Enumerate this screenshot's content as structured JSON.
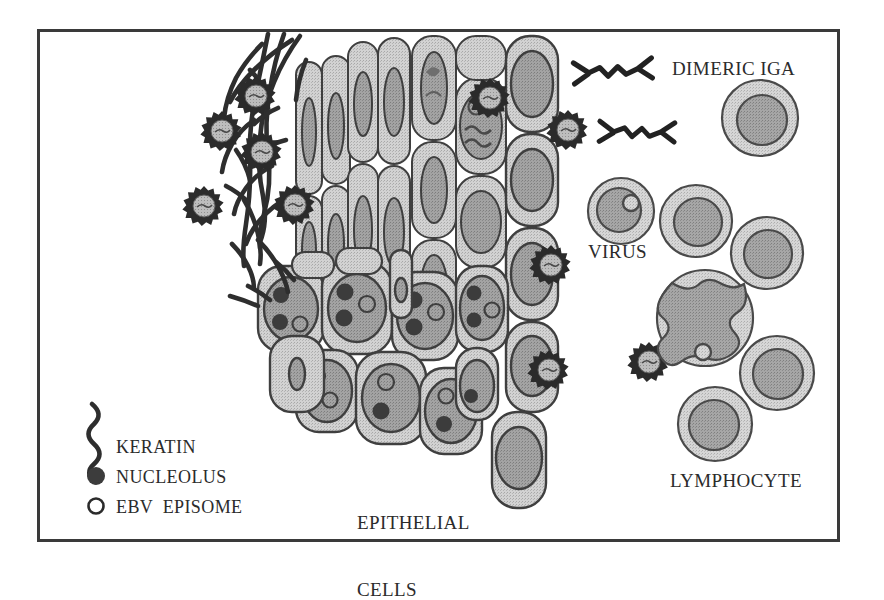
{
  "figure": {
    "background_color": "#ffffff",
    "frame": {
      "stroke_color": "#3a3a3a",
      "x": 38,
      "y": 30,
      "width": 800,
      "height": 510
    }
  },
  "palette": {
    "ink": "#2b2b2b",
    "outline": "#404040",
    "cytoplasm": "#c9c9c9",
    "nucleus": "#989898",
    "nucleolus": "#3c3c3c",
    "episome_fill": "#c9c9c9",
    "keratin": "#2e2e2e",
    "virus_spike": "#2b2b2b",
    "virus_core": "#b4b4b4",
    "lymph_cytoplasm": "#cfcfcf",
    "lymph_nucleus": "#9a9a9a"
  },
  "labels": {
    "dimeric_iga": "DIMERIC IGA",
    "virus": "VIRUS",
    "epithelial_cells_line1": "EPITHELIAL",
    "epithelial_cells_line2": "CELLS",
    "lymphocyte": "LYMPHOCYTE"
  },
  "legend": {
    "items": [
      {
        "key": "keratin",
        "symbol": "squiggle-line",
        "label": "KERATIN"
      },
      {
        "key": "nucleolus",
        "symbol": "filled-circle",
        "label": "NUCLEOLUS"
      },
      {
        "key": "episome",
        "symbol": "open-circle",
        "label": "EBV  EPISOME"
      }
    ]
  },
  "diagram_content": {
    "regions": [
      {
        "name": "lumen",
        "description": "empty space at left containing free virus particles"
      },
      {
        "name": "keratin-layer",
        "description": "dense dark keratin fiber meshwork at epithelial surface with embedded virions"
      },
      {
        "name": "squamous-layer",
        "description": "thin flattened epithelial cells with elongated nuclei"
      },
      {
        "name": "columnar-layer",
        "description": "taller epithelial cells with round nuclei, some containing replicating virus"
      },
      {
        "name": "basal-layer",
        "description": "rounded basal epithelial cells with nucleoli and EBV episomes"
      },
      {
        "name": "lymphoid-space",
        "description": "right field containing lymphocytes and free virus"
      }
    ],
    "free_viruses": [
      {
        "cx": 222,
        "cy": 131,
        "r": 19
      },
      {
        "cx": 204,
        "cy": 206,
        "r": 19
      },
      {
        "cx": 256,
        "cy": 96,
        "r": 18
      },
      {
        "cx": 262,
        "cy": 152,
        "r": 18
      },
      {
        "cx": 295,
        "cy": 205,
        "r": 18
      },
      {
        "cx": 504,
        "cy": 112,
        "r": 17
      },
      {
        "cx": 568,
        "cy": 130,
        "r": 20
      },
      {
        "cx": 551,
        "cy": 265,
        "r": 19
      },
      {
        "cx": 549,
        "cy": 370,
        "r": 19
      },
      {
        "cx": 649,
        "cy": 362,
        "r": 19
      },
      {
        "cx": 490,
        "cy": 98,
        "r": 17
      }
    ],
    "epithelial_cells_count": 38,
    "lymphocytes": [
      {
        "cx": 760,
        "cy": 118,
        "r": 38,
        "nucleus_r": 25,
        "episome": false,
        "lobulated": false
      },
      {
        "cx": 621,
        "cy": 211,
        "r": 33,
        "nucleus_r": 22,
        "episome": true,
        "lobulated": false
      },
      {
        "cx": 696,
        "cy": 221,
        "r": 36,
        "nucleus_r": 24,
        "episome": false,
        "lobulated": false
      },
      {
        "cx": 767,
        "cy": 253,
        "r": 36,
        "nucleus_r": 24,
        "episome": false,
        "lobulated": false
      },
      {
        "cx": 705,
        "cy": 318,
        "r": 48,
        "nucleus_r": 0,
        "episome": true,
        "lobulated": true
      },
      {
        "cx": 777,
        "cy": 373,
        "r": 37,
        "nucleus_r": 25,
        "episome": false,
        "lobulated": false
      },
      {
        "cx": 715,
        "cy": 424,
        "r": 37,
        "nucleus_r": 25,
        "episome": false,
        "lobulated": false
      }
    ],
    "dimeric_iga_molecules": [
      {
        "x": 600,
        "y": 72,
        "scale": 1.0,
        "note": "legend example, free"
      },
      {
        "x": 622,
        "y": 133,
        "scale": 1.0,
        "note": "bound to virion at left end"
      }
    ]
  }
}
